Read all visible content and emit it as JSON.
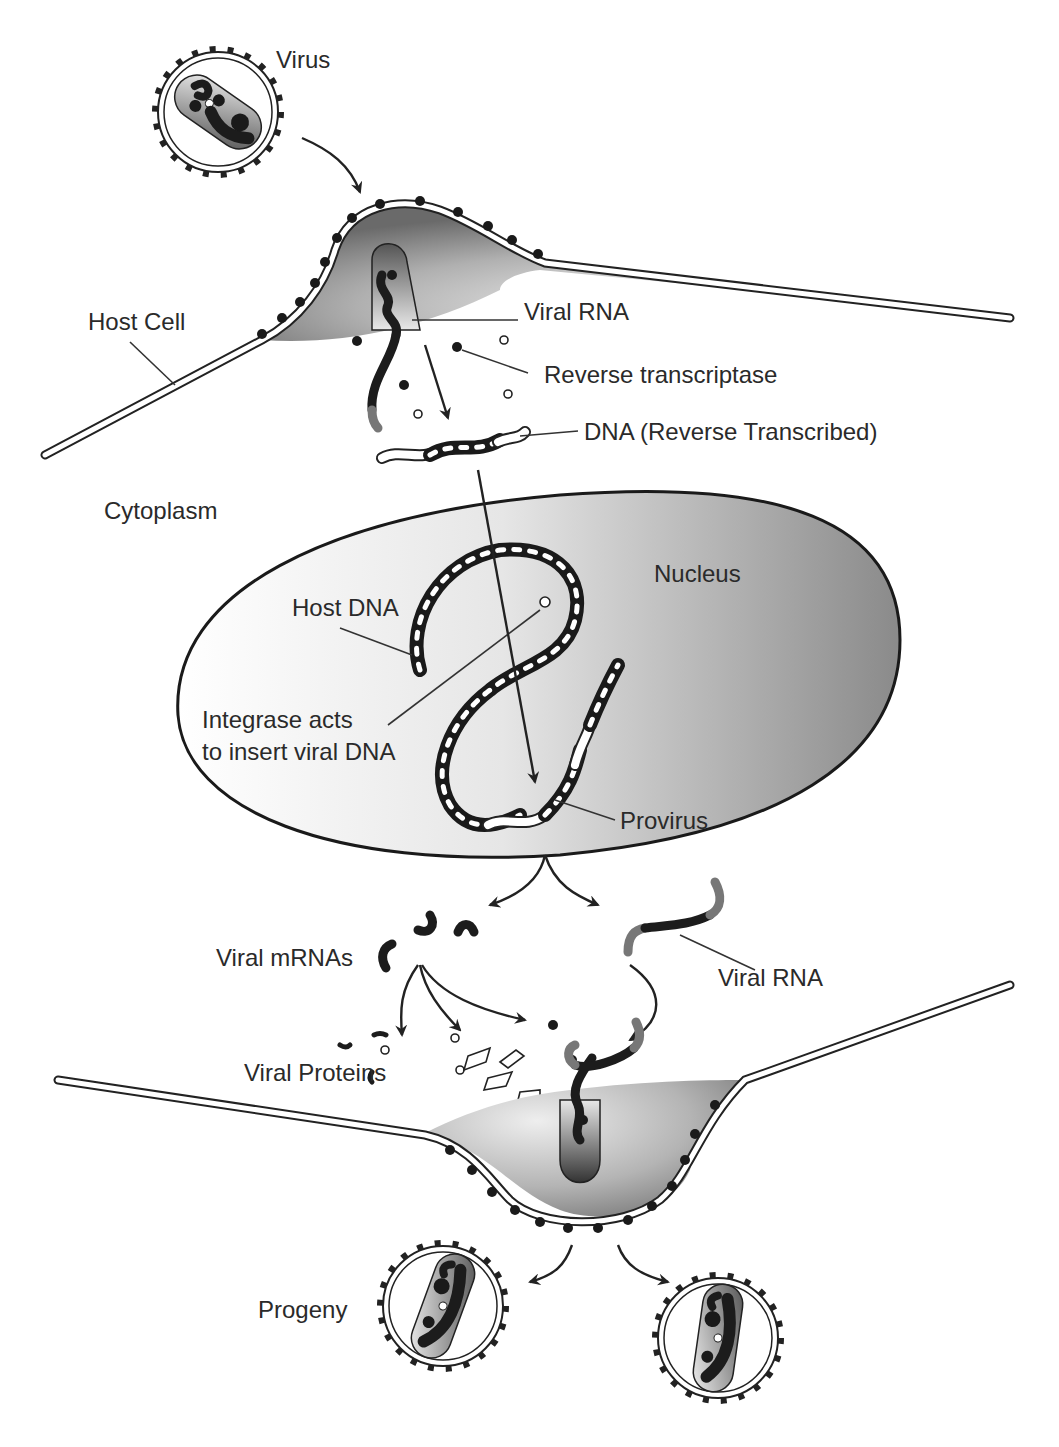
{
  "labels": {
    "virus": "Virus",
    "host_cell": "Host Cell",
    "viral_rna_top": "Viral RNA",
    "reverse_transcriptase": "Reverse transcriptase",
    "dna_reverse_transcribed": "DNA (Reverse Transcribed)",
    "cytoplasm": "Cytoplasm",
    "nucleus": "Nucleus",
    "host_dna": "Host DNA",
    "integrase_line1": "Integrase acts",
    "integrase_line2": "to insert viral DNA",
    "provirus": "Provirus",
    "viral_mrnas": "Viral mRNAs",
    "viral_rna_bottom": "Viral RNA",
    "viral_proteins": "Viral Proteins",
    "progeny": "Progeny"
  },
  "colors": {
    "ink": "#1a1a1a",
    "label": "#2a2a2a",
    "shade_dark": "#6e6e6e",
    "shade_light": "#f2f2f2",
    "background": "#ffffff"
  }
}
